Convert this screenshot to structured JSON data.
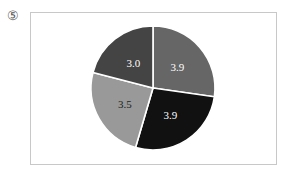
{
  "label": "⑤",
  "chart_data": {
    "type": "pie",
    "title": "",
    "categories": [
      "A",
      "B",
      "C",
      "D"
    ],
    "values": [
      3.9,
      3.9,
      3.5,
      3.0
    ],
    "labels": [
      "3.9",
      "3.9",
      "3.5",
      "3.0"
    ],
    "colors": [
      "#666666",
      "#111111",
      "#999999",
      "#444444"
    ],
    "label_colors": [
      "#ffffff",
      "#ffffff",
      "#222222",
      "#ffffff"
    ],
    "start_angle_deg": 0,
    "direction": "clockwise",
    "legend": "none"
  }
}
